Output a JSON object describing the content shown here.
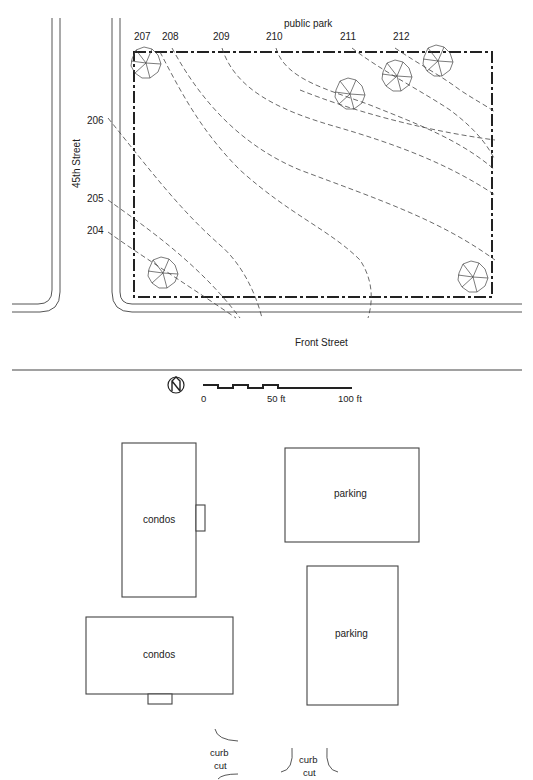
{
  "site_plan": {
    "top_label": "public park",
    "left_street": "45th Street",
    "bottom_street": "Front Street",
    "contour_labels": [
      {
        "text": "207",
        "x": 134,
        "y": 40
      },
      {
        "text": "208",
        "x": 162,
        "y": 40
      },
      {
        "text": "209",
        "x": 213,
        "y": 40
      },
      {
        "text": "210",
        "x": 266,
        "y": 40
      },
      {
        "text": "211",
        "x": 340,
        "y": 40
      },
      {
        "text": "212",
        "x": 393,
        "y": 40
      },
      {
        "text": "206",
        "x": 87,
        "y": 124
      },
      {
        "text": "205",
        "x": 87,
        "y": 202
      },
      {
        "text": "204",
        "x": 87,
        "y": 234
      }
    ],
    "colors": {
      "line": "#444444",
      "property_line": "#222222",
      "background": "#ffffff"
    }
  },
  "legend": {
    "north_icon": "north-arrow-icon",
    "scale_labels": [
      "0",
      "50 ft",
      "100 ft"
    ]
  },
  "proposal": {
    "buildings": [
      {
        "id": "condos-1",
        "label": "condos"
      },
      {
        "id": "parking-1",
        "label": "parking"
      },
      {
        "id": "condos-2",
        "label": "condos"
      },
      {
        "id": "parking-2",
        "label": "parking"
      }
    ],
    "curb_cuts": [
      {
        "line1": "curb",
        "line2": "cut"
      },
      {
        "line1": "curb",
        "line2": "cut"
      }
    ]
  }
}
